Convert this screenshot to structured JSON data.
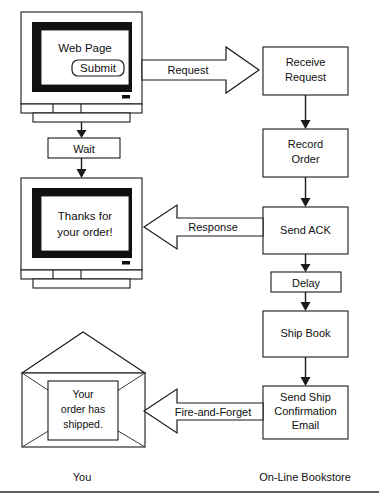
{
  "diagram": {
    "type": "flow-diagram",
    "colors": {
      "stroke": "#1a1a1a",
      "fill": "#ffffff",
      "bezel": "#111111",
      "text": "#101010"
    },
    "lanes": [
      {
        "id": "lane-you",
        "label": "You"
      },
      {
        "id": "lane-bookstore",
        "label": "On-Line Bookstore"
      }
    ],
    "monitors": [
      {
        "id": "monitor-web-page",
        "screen_text": "Web Page",
        "button_label": "Submit"
      },
      {
        "id": "monitor-thanks",
        "screen_text_line1": "Thanks for",
        "screen_text_line2": "your order!"
      }
    ],
    "envelope": {
      "id": "envelope-shipped",
      "letter_line1": "Your",
      "letter_line2": "order has",
      "letter_line3": "shipped."
    },
    "client_nodes": [
      {
        "id": "node-wait",
        "label": "Wait"
      }
    ],
    "server_nodes": [
      {
        "id": "node-receive-request",
        "line1": "Receive",
        "line2": "Request"
      },
      {
        "id": "node-record-order",
        "line1": "Record",
        "line2": "Order"
      },
      {
        "id": "node-send-ack",
        "line1": "Send ACK",
        "line2": ""
      },
      {
        "id": "node-delay",
        "line1": "Delay",
        "line2": ""
      },
      {
        "id": "node-ship-book",
        "line1": "Ship Book",
        "line2": ""
      },
      {
        "id": "node-send-ship-email",
        "line1": "Send Ship",
        "line2": "Confirmation",
        "line3": "Email"
      }
    ],
    "message_arrows": [
      {
        "id": "arrow-request",
        "label": "Request",
        "direction": "right"
      },
      {
        "id": "arrow-response",
        "label": "Response",
        "direction": "left"
      },
      {
        "id": "arrow-fire-and-forget",
        "label": "Fire-and-Forget",
        "direction": "left"
      }
    ]
  }
}
